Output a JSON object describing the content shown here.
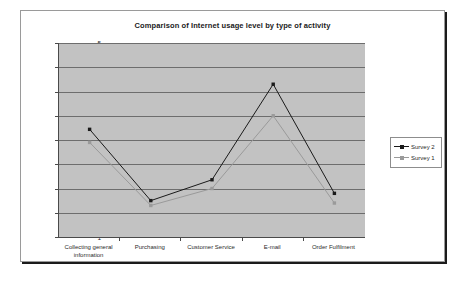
{
  "chart_data": {
    "type": "line",
    "title": "Comparison of Internet usage level by type of activity",
    "xlabel": "",
    "ylabel": "",
    "ylim": [
      1,
      5
    ],
    "ytick_labels": [
      "5",
      "4.5",
      "4",
      "3.5",
      "3",
      "2.5",
      "2",
      "1.5",
      "1"
    ],
    "ytick_values": [
      5,
      4.5,
      4,
      3.5,
      3,
      2.5,
      2,
      1.5,
      1
    ],
    "grid": true,
    "legend_position": "right",
    "categories": [
      "Collecting general information",
      "Purchasing",
      "Customer Service",
      "E-mail",
      "Order Fulfilment"
    ],
    "category_lines": [
      [
        "Collecting general",
        "information"
      ],
      [
        "Purchasing"
      ],
      [
        "Customer Service"
      ],
      [
        "E-mail"
      ],
      [
        "Order Fulfilment"
      ]
    ],
    "series": [
      {
        "name": "Survey 2",
        "color": "#1a1a1a",
        "values": [
          3.22,
          1.75,
          2.18,
          4.15,
          1.9
        ]
      },
      {
        "name": "Survey 1",
        "color": "#9a9a9a",
        "values": [
          2.95,
          1.65,
          2.0,
          3.5,
          1.7
        ]
      }
    ]
  },
  "legend": {
    "entries": [
      {
        "label": "Survey 2",
        "color": "#1a1a1a"
      },
      {
        "label": "Survey 1",
        "color": "#9a9a9a"
      }
    ]
  },
  "colors": {
    "plot_background": "#c2c2c2",
    "gridline": "#6d6d6d",
    "axis": "#4a4a4a",
    "frame_border": "#9a9a9a",
    "page_background": "#ffffff"
  }
}
